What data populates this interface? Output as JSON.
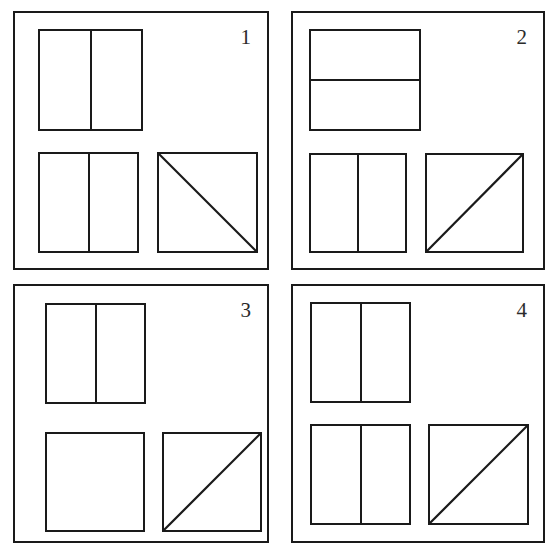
{
  "figure": {
    "kind": "geometric-partition-puzzle",
    "background_color": "#ffffff",
    "line_color": "#1a1a1a",
    "panel_count": 4
  },
  "panels": [
    {
      "label": "1",
      "shapes": [
        {
          "name": "top-rectangle",
          "outline": "rectangle",
          "division": "vertical-midline",
          "parts": 2
        },
        {
          "name": "bottom-left-square",
          "outline": "square",
          "division": "vertical-midline",
          "parts": 2
        },
        {
          "name": "bottom-right-square",
          "outline": "square",
          "division": "diagonal-top-left-to-bottom-right",
          "parts": 2
        }
      ]
    },
    {
      "label": "2",
      "shapes": [
        {
          "name": "top-rectangle",
          "outline": "rectangle",
          "division": "horizontal-midline",
          "parts": 2
        },
        {
          "name": "bottom-left-square",
          "outline": "square",
          "division": "vertical-midline",
          "parts": 2
        },
        {
          "name": "bottom-right-square",
          "outline": "square",
          "division": "diagonal-bottom-left-to-top-right",
          "parts": 2
        }
      ]
    },
    {
      "label": "3",
      "shapes": [
        {
          "name": "top-rectangle",
          "outline": "rectangle",
          "division": "vertical-midline",
          "parts": 2
        },
        {
          "name": "bottom-left-square",
          "outline": "square",
          "division": "none",
          "parts": 1
        },
        {
          "name": "bottom-right-square",
          "outline": "square",
          "division": "diagonal-bottom-left-to-top-right",
          "parts": 2
        }
      ]
    },
    {
      "label": "4",
      "shapes": [
        {
          "name": "top-rectangle",
          "outline": "rectangle",
          "division": "vertical-midline",
          "parts": 2
        },
        {
          "name": "bottom-left-square",
          "outline": "square",
          "division": "vertical-midline",
          "parts": 2
        },
        {
          "name": "bottom-right-square",
          "outline": "square",
          "division": "diagonal-bottom-left-to-top-right",
          "parts": 2
        }
      ]
    }
  ]
}
